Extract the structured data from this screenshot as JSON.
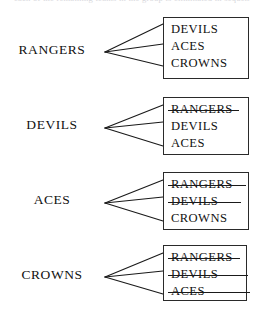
{
  "figure": {
    "top_cut_text": "each of the remaining teams in the group is eliminated in sequence",
    "line_color": "#1a1a1a",
    "box_border_color": "#2a2a2a",
    "text_color": "#111111",
    "background_color": "#ffffff"
  },
  "groups": [
    {
      "label": "RANGERS",
      "label_top": 42,
      "box_top": 17,
      "box_width": 86,
      "box_height": 62,
      "fan_apex_x": 4,
      "fan_apex_y": 52,
      "fan_targets": [
        24,
        44,
        66
      ],
      "opponents": [
        {
          "name": "DEVILS",
          "struck": false,
          "strike_width": 0
        },
        {
          "name": "ACES",
          "struck": false,
          "strike_width": 0
        },
        {
          "name": "CROWNS",
          "struck": false,
          "strike_width": 0
        }
      ]
    },
    {
      "label": "DEVILS",
      "label_top": 117,
      "box_top": 97,
      "box_width": 86,
      "box_height": 58,
      "fan_apex_x": 4,
      "fan_apex_y": 128,
      "fan_targets": [
        105,
        122,
        146
      ],
      "opponents": [
        {
          "name": "RANGERS",
          "struck": true,
          "strike_width": 71
        },
        {
          "name": "DEVILS",
          "struck": false,
          "strike_width": 0
        },
        {
          "name": "ACES",
          "struck": false,
          "strike_width": 0
        }
      ]
    },
    {
      "label": "ACES",
      "label_top": 192,
      "box_top": 172,
      "box_width": 86,
      "box_height": 58,
      "fan_apex_x": 4,
      "fan_apex_y": 203,
      "fan_targets": [
        180,
        197,
        221
      ],
      "opponents": [
        {
          "name": "RANGERS",
          "struck": true,
          "strike_width": 78
        },
        {
          "name": "DEVILS",
          "struck": true,
          "strike_width": 73
        },
        {
          "name": "CROWNS",
          "struck": false,
          "strike_width": 0
        }
      ]
    },
    {
      "label": "CROWNS",
      "label_top": 267,
      "box_top": 245,
      "box_width": 84,
      "box_height": 56,
      "fan_apex_x": 4,
      "fan_apex_y": 277,
      "fan_targets": [
        253,
        271,
        294
      ],
      "opponents": [
        {
          "name": "RANGERS",
          "struck": true,
          "strike_width": 72
        },
        {
          "name": "DEVILS",
          "struck": true,
          "strike_width": 80
        },
        {
          "name": "ACES",
          "struck": true,
          "strike_width": 82
        }
      ]
    }
  ]
}
